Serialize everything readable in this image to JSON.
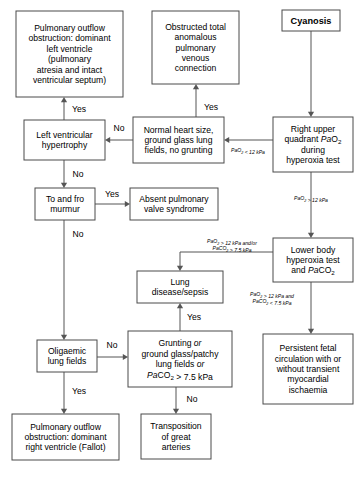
{
  "diagram": {
    "stroke_color": "#4a4a4a",
    "edge_color": "#555555",
    "background": "#ffffff",
    "nodes": [
      {
        "id": "cyanosis",
        "name": "node-cyanosis",
        "bold": true,
        "x": 282,
        "y": 10,
        "w": 58,
        "h": 21,
        "lines": [
          {
            "text": "Cyanosis"
          }
        ]
      },
      {
        "id": "ruq",
        "name": "node-right-upper-quadrant-pao2",
        "bold": false,
        "x": 273,
        "y": 117,
        "w": 80,
        "h": 55,
        "lines": [
          {
            "text": "Right upper"
          },
          {
            "parts": [
              {
                "t": "quadrant "
              },
              {
                "t": "Pa",
                "style": "italic"
              },
              {
                "t": "O"
              },
              {
                "t": "2",
                "style": "sub"
              }
            ]
          },
          {
            "text": "during"
          },
          {
            "text": "hyperoxia test"
          }
        ]
      },
      {
        "id": "normal_heart",
        "name": "node-normal-heart-size",
        "bold": false,
        "x": 133,
        "y": 117,
        "w": 91,
        "h": 46,
        "lines": [
          {
            "text": "Normal heart size,"
          },
          {
            "text": "ground glass lung"
          },
          {
            "text": "fields, no grunting"
          }
        ]
      },
      {
        "id": "lvh",
        "name": "node-left-ventricular-hypertrophy",
        "bold": false,
        "x": 24,
        "y": 120,
        "w": 81,
        "h": 40,
        "lines": [
          {
            "text": "Left ventricular"
          },
          {
            "text": "hypertrophy"
          }
        ]
      },
      {
        "id": "pulm_outflow_lv",
        "name": "node-pulmonary-outflow-obstruction-left-ventricle",
        "bold": false,
        "x": 16,
        "y": 11,
        "w": 107,
        "h": 86,
        "lines": [
          {
            "text": "Pulmonary outflow"
          },
          {
            "text": "obstruction: dominant"
          },
          {
            "text": "left ventricle"
          },
          {
            "text": "(pulmonary"
          },
          {
            "text": "atresia and intact"
          },
          {
            "text": "ventricular septum)"
          }
        ]
      },
      {
        "id": "tapvc",
        "name": "node-obstructed-tapvc",
        "bold": false,
        "x": 152,
        "y": 11,
        "w": 87,
        "h": 73,
        "lines": [
          {
            "text": "Obstructed total"
          },
          {
            "text": "anomalous"
          },
          {
            "text": "pulmonary"
          },
          {
            "text": "venous"
          },
          {
            "text": "connection"
          }
        ]
      },
      {
        "id": "murmur",
        "name": "node-to-and-fro-murmur",
        "bold": false,
        "x": 35,
        "y": 188,
        "w": 60,
        "h": 32,
        "lines": [
          {
            "text": "To and fro"
          },
          {
            "text": "murmur"
          }
        ]
      },
      {
        "id": "absent_valve",
        "name": "node-absent-pulmonary-valve-syndrome",
        "bold": false,
        "x": 130,
        "y": 188,
        "w": 88,
        "h": 32,
        "lines": [
          {
            "text": "Absent pulmonary"
          },
          {
            "text": "valve syndrome"
          }
        ]
      },
      {
        "id": "lower_body",
        "name": "node-lower-body-hyperoxia-test",
        "bold": false,
        "x": 273,
        "y": 238,
        "w": 80,
        "h": 44,
        "lines": [
          {
            "text": "Lower body"
          },
          {
            "text": "hyperoxia test"
          },
          {
            "parts": [
              {
                "t": "and "
              },
              {
                "t": "Pa",
                "style": "italic"
              },
              {
                "t": "CO"
              },
              {
                "t": "2",
                "style": "sub"
              }
            ]
          }
        ]
      },
      {
        "id": "lung_disease",
        "name": "node-lung-disease-sepsis",
        "bold": false,
        "x": 137,
        "y": 271,
        "w": 86,
        "h": 32,
        "lines": [
          {
            "text": "Lung"
          },
          {
            "text": "disease/sepsis"
          }
        ]
      },
      {
        "id": "pfc",
        "name": "node-persistent-fetal-circulation",
        "bold": false,
        "x": 263,
        "y": 334,
        "w": 90,
        "h": 70,
        "lines": [
          {
            "text": "Persistent fetal"
          },
          {
            "text": "circulation with or"
          },
          {
            "text": "without transient"
          },
          {
            "text": "myocardial"
          },
          {
            "text": "ischaemia"
          }
        ]
      },
      {
        "id": "oligaemic",
        "name": "node-oligaemic-lung-fields",
        "bold": false,
        "x": 37,
        "y": 340,
        "w": 60,
        "h": 32,
        "lines": [
          {
            "text": "Oligaemic"
          },
          {
            "text": "lung fields"
          }
        ]
      },
      {
        "id": "grunting",
        "name": "node-grunting-ground-glass",
        "bold": false,
        "x": 128,
        "y": 331,
        "w": 104,
        "h": 56,
        "lines": [
          {
            "parts": [
              {
                "t": "Grunting "
              },
              {
                "t": "or",
                "style": "italic"
              }
            ]
          },
          {
            "text": "ground glass/patchy"
          },
          {
            "parts": [
              {
                "t": "lung fields "
              },
              {
                "t": "or",
                "style": "italic"
              }
            ]
          },
          {
            "parts": [
              {
                "t": "Pa",
                "style": "italic"
              },
              {
                "t": "CO"
              },
              {
                "t": "2",
                "style": "sub"
              },
              {
                "t": " > 7.5 kPa"
              }
            ]
          }
        ]
      },
      {
        "id": "pulm_outflow_rv",
        "name": "node-pulmonary-outflow-obstruction-right-ventricle",
        "bold": false,
        "x": 12,
        "y": 414,
        "w": 107,
        "h": 46,
        "lines": [
          {
            "text": "Pulmonary outflow"
          },
          {
            "text": "obstruction: dominant"
          },
          {
            "text": "right ventricle (Fallot)"
          }
        ]
      },
      {
        "id": "tga",
        "name": "node-transposition-great-arteries",
        "bold": false,
        "x": 141,
        "y": 414,
        "w": 70,
        "h": 45,
        "lines": [
          {
            "text": "Transposition"
          },
          {
            "text": "of great"
          },
          {
            "text": "arteries"
          }
        ]
      }
    ],
    "edges": [
      {
        "name": "edge-cyanosis-to-ruq",
        "points": "311,31 311,117",
        "arrow": "down"
      },
      {
        "name": "edge-ruq-to-normal-heart",
        "points": "273,140 224,140",
        "arrow": "left"
      },
      {
        "name": "edge-normal-heart-to-lvh",
        "points": "133,140 105,140",
        "arrow": "left"
      },
      {
        "name": "edge-normal-heart-to-tapvc",
        "points": "196,117 196,84",
        "arrow": "up"
      },
      {
        "name": "edge-lvh-to-pulm-outflow-lv",
        "points": "64,120 64,97",
        "arrow": "up"
      },
      {
        "name": "edge-lvh-to-murmur",
        "points": "64,160 64,188",
        "arrow": "down"
      },
      {
        "name": "edge-murmur-to-absent-valve",
        "points": "95,204 130,204",
        "arrow": "right"
      },
      {
        "name": "edge-ruq-to-lower-body",
        "points": "311,172 311,238",
        "arrow": "down"
      },
      {
        "name": "edge-lower-body-to-lung-disease",
        "points": "273,252 180,252 180,271",
        "arrow": "down"
      },
      {
        "name": "edge-lower-body-to-pfc",
        "points": "311,282 311,334",
        "arrow": "down"
      },
      {
        "name": "edge-murmur-to-oligaemic",
        "points": "64,220 64,340",
        "arrow": "down"
      },
      {
        "name": "edge-oligaemic-to-grunting",
        "points": "97,357 128,357",
        "arrow": "right"
      },
      {
        "name": "edge-grunting-to-lung-disease",
        "points": "180,331 180,303",
        "arrow": "up"
      },
      {
        "name": "edge-oligaemic-to-pulm-outflow-rv",
        "points": "64,372 64,414",
        "arrow": "down"
      },
      {
        "name": "edge-grunting-to-tga",
        "points": "176,387 176,414",
        "arrow": "down"
      }
    ],
    "edge_labels": [
      {
        "name": "edge-label-lvh-yes",
        "text": "Yes",
        "x": 79,
        "y": 112,
        "type": "answer"
      },
      {
        "name": "edge-label-lvh-no",
        "text": "No",
        "x": 78,
        "y": 177,
        "type": "answer"
      },
      {
        "name": "edge-label-normal-heart-no",
        "text": "No",
        "x": 119,
        "y": 131,
        "type": "answer"
      },
      {
        "name": "edge-label-tapvc-yes",
        "text": "Yes",
        "x": 211,
        "y": 110,
        "type": "answer"
      },
      {
        "name": "edge-label-murmur-yes",
        "text": "Yes",
        "x": 112,
        "y": 197,
        "type": "answer"
      },
      {
        "name": "edge-label-murmur-no",
        "text": "No",
        "x": 78,
        "y": 237,
        "type": "answer"
      },
      {
        "name": "edge-label-oligaemic-no",
        "text": "No",
        "x": 112,
        "y": 348,
        "type": "answer"
      },
      {
        "name": "edge-label-oligaemic-yes",
        "text": "Yes",
        "x": 79,
        "y": 394,
        "type": "answer"
      },
      {
        "name": "edge-label-grunting-yes",
        "text": "Yes",
        "x": 194,
        "y": 320,
        "type": "answer"
      },
      {
        "name": "edge-label-grunting-no",
        "text": "No",
        "x": 192,
        "y": 402,
        "type": "answer"
      }
    ],
    "condition_labels": [
      {
        "name": "cond-label-pao2-less-12",
        "x": 248,
        "y": 152,
        "lines": [
          {
            "parts": [
              {
                "t": "Pa",
                "style": "italic"
              },
              {
                "t": "O"
              },
              {
                "t": "2",
                "style": "sub"
              },
              {
                "t": " < 12 kPa"
              }
            ]
          }
        ]
      },
      {
        "name": "cond-label-pao2-greater-12",
        "x": 311,
        "y": 200,
        "lines": [
          {
            "parts": [
              {
                "t": "Pa",
                "style": "italic"
              },
              {
                "t": "O"
              },
              {
                "t": "2",
                "style": "sub"
              },
              {
                "t": " > 12 kPa"
              }
            ]
          }
        ]
      },
      {
        "name": "cond-label-pao2-12-and-or-paco2-75",
        "x": 232,
        "y": 243,
        "lines": [
          {
            "parts": [
              {
                "t": "Pa",
                "style": "italic"
              },
              {
                "t": "O"
              },
              {
                "t": "2",
                "style": "sub"
              },
              {
                "t": " > 12 kPa "
              },
              {
                "t": "and/or",
                "style": "italic"
              }
            ]
          },
          {
            "parts": [
              {
                "t": "Pa",
                "style": "italic"
              },
              {
                "t": "CO"
              },
              {
                "t": "2",
                "style": "sub"
              },
              {
                "t": " > 7.5 kPa"
              }
            ]
          }
        ]
      },
      {
        "name": "cond-label-pao2-12-and-paco2-less-75",
        "x": 272,
        "y": 296,
        "lines": [
          {
            "parts": [
              {
                "t": "Pa",
                "style": "italic"
              },
              {
                "t": "O"
              },
              {
                "t": "2",
                "style": "sub"
              },
              {
                "t": " > 12 kPa "
              },
              {
                "t": "and",
                "style": "italic"
              }
            ]
          },
          {
            "parts": [
              {
                "t": "Pa",
                "style": "italic"
              },
              {
                "t": "CO"
              },
              {
                "t": "2",
                "style": "sub"
              },
              {
                "t": " < 7.5 kPa"
              }
            ]
          }
        ]
      }
    ]
  }
}
